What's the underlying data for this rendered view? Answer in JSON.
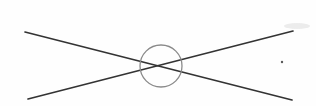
{
  "figure": {
    "width": 316,
    "height": 106,
    "background_color": "#fefefe"
  },
  "chart_data": {
    "type": "diagram",
    "xlabel": "",
    "ylabel": "",
    "grid": false,
    "legend": null,
    "xlim": [
      0,
      316
    ],
    "ylim": [
      0,
      106
    ],
    "elements": [
      {
        "name": "line-descending",
        "type": "line",
        "description": "Straight line running from upper-left down to lower-right",
        "x1": 25,
        "y1": 32,
        "x2": 292,
        "y2": 100,
        "color": "#333333",
        "width": 1.7
      },
      {
        "name": "line-ascending",
        "type": "line",
        "description": "Straight line running from lower-left up to upper-right",
        "x1": 28,
        "y1": 99,
        "x2": 293,
        "y2": 31,
        "color": "#333333",
        "width": 1.7
      },
      {
        "name": "intersection-circle",
        "type": "circle",
        "description": "Open circle centered on the crossing point of the two lines",
        "cx": 161,
        "cy": 66,
        "r": 21,
        "color": "#8a8a8a",
        "width": 1.3,
        "fill": "none"
      },
      {
        "name": "ink-speck",
        "type": "point",
        "description": "Small dark speck to the right of the circle",
        "cx": 282,
        "cy": 62,
        "r": 1.2,
        "color": "#5a5a5a"
      },
      {
        "name": "faint-smudge",
        "type": "smudge",
        "description": "Very faint gray smudge near the upper-right corner",
        "cx": 297,
        "cy": 26,
        "rx": 13,
        "ry": 3,
        "color": "#dcdcdc"
      }
    ],
    "intersection_point": {
      "x": 161,
      "y": 66,
      "label": ""
    },
    "annotations": []
  }
}
